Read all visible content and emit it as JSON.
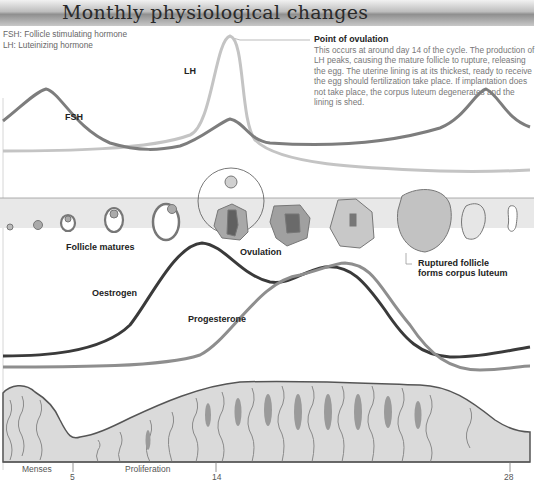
{
  "header": {
    "title": "Monthly physiological changes"
  },
  "legend": {
    "fsh": "FSH: Follicle stimulating hormone",
    "lh": "LH: Luteinizing hormone"
  },
  "note": {
    "title": "Point of ovulation",
    "body": "This occurs at around day 14 of the cycle. The production of LH peaks, causing the mature follicle to rupture, releasing the egg. The uterine lining is at its thickest, ready to receive the egg should fertilization take place. If implantation does not take place, the corpus luteum degenerates and the lining is shed."
  },
  "labels": {
    "lh": "LH",
    "fsh": "FSH",
    "follicle_matures": "Follicle matures",
    "ovulation": "Ovulation",
    "ruptured_1": "Ruptured follicle",
    "ruptured_2": "forms corpus luteum",
    "oestrogen": "Oestrogen",
    "progesterone": "Progesterone",
    "menses": "Menses",
    "proliferation": "Proliferation"
  },
  "axis": {
    "day5": "5",
    "day14": "14",
    "day28": "28"
  },
  "colors": {
    "fsh": "#7d7d7d",
    "lh": "#c4c4c4",
    "oestrogen": "#3a3a3a",
    "progesterone": "#8e8e8e",
    "lining": "#d9d9d9"
  }
}
